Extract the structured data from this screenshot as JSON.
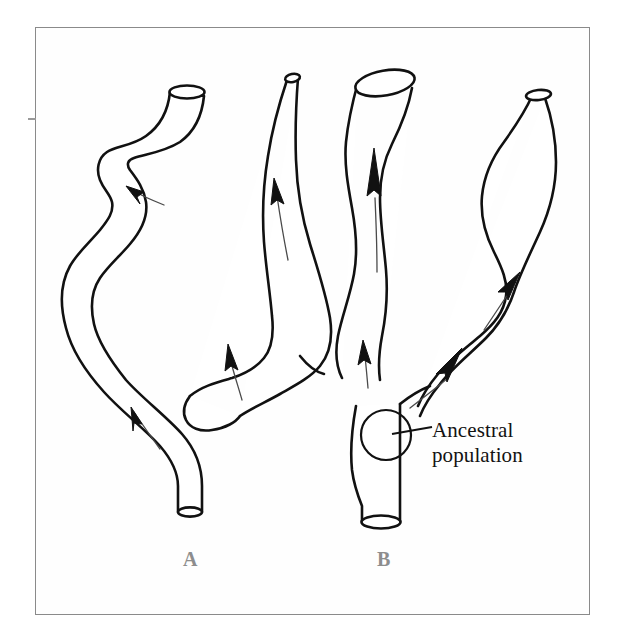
{
  "figure": {
    "domain": "Diagram",
    "type": "scientific-illustration",
    "background_color": "#ffffff",
    "border_color": "#8a8a8a",
    "ink_color": "#111111",
    "caption_color": "#8d8d8d"
  },
  "panels": [
    {
      "id": "A",
      "label": "A",
      "name": "panel-a-anagenesis",
      "description": "Single unbranched meandering tube lineage with two internal flow arrows pointing upward, open at both ends",
      "arrow_count": 2
    },
    {
      "id": "B",
      "label": "B",
      "name": "panel-b-cladogenesis",
      "description": "Single basal tube that splits into three diverging branches, each with an internal flow arrow, open at all ends",
      "arrow_count": 5,
      "branch_count": 3
    }
  ],
  "annotation": {
    "marker": "circle",
    "marker_name": "ancestral-population-circle",
    "leader_line": true,
    "label_line_1": "Ancestral",
    "label_line_2": "population"
  },
  "geometry": {
    "border": {
      "x": 35,
      "y": 27,
      "width": 555,
      "height": 588
    },
    "panel_a_caption": {
      "x": 183,
      "y": 548
    },
    "panel_b_caption": {
      "x": 377,
      "y": 548
    },
    "ancestral_circle": {
      "cx": 386,
      "cy": 435,
      "r": 25
    },
    "leader_line": {
      "x1": 392,
      "y1": 434,
      "x2": 432,
      "y2": 427
    }
  }
}
